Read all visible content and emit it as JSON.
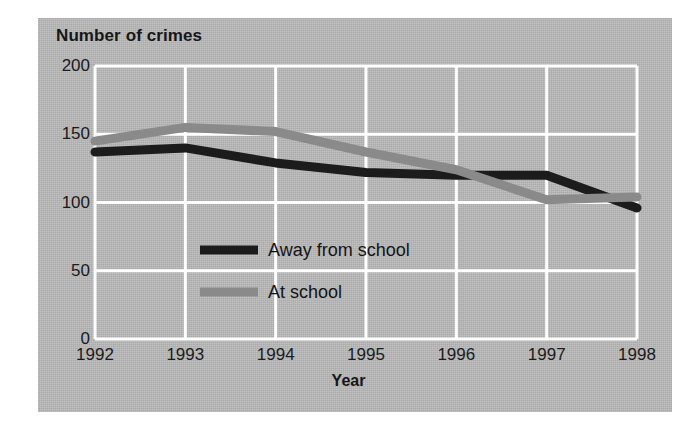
{
  "chart_data": {
    "type": "line",
    "title": "Number of crimes",
    "xlabel": "Year",
    "ylabel": "Number of crimes",
    "categories": [
      "1992",
      "1993",
      "1994",
      "1995",
      "1996",
      "1997",
      "1998"
    ],
    "x": [
      1992,
      1993,
      1994,
      1995,
      1996,
      1997,
      1998
    ],
    "xlim": [
      1992,
      1998
    ],
    "ylim": [
      0,
      200
    ],
    "yticks": [
      0,
      50,
      100,
      150,
      200
    ],
    "grid": true,
    "grid_color": "#ffffff",
    "background": "#b9b9b9",
    "legend_position": "center",
    "series": [
      {
        "name": "Away from school",
        "color": "#1c1c1c",
        "values": [
          137,
          140,
          129,
          122,
          120,
          120,
          96
        ]
      },
      {
        "name": "At school",
        "color": "#8a8a8a",
        "values": [
          145,
          155,
          152,
          137,
          124,
          102,
          104
        ]
      }
    ]
  },
  "axes": {
    "y_ticks": [
      "200",
      "150",
      "100",
      "50",
      "0"
    ],
    "x_ticks": [
      "1992",
      "1993",
      "1994",
      "1995",
      "1996",
      "1997",
      "1998"
    ],
    "x_axis_title": "Year",
    "y_axis_title": "Number of crimes"
  },
  "legend": {
    "items": [
      {
        "label": "Away from school",
        "color": "#1c1c1c"
      },
      {
        "label": "At school",
        "color": "#8a8a8a"
      }
    ]
  }
}
